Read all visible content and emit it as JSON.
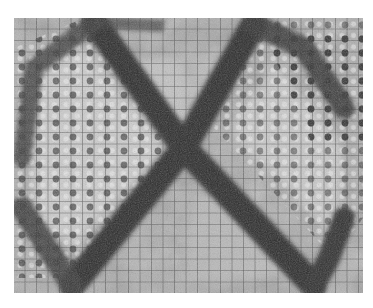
{
  "image": {
    "description": "Grayscale halftone micrograph showing a square grid with an X-shaped dark band formed by two crossing diagonal strips",
    "colors": {
      "background": "#ffffff",
      "field_light": "#bdbdbd",
      "field_mid": "#8a8a8a",
      "band_dark": "#2a2a2a",
      "grid_line": "#3a3a3a",
      "dot": "#262626"
    },
    "bounds": {
      "x": 14,
      "y": 18,
      "width": 349,
      "height": 275
    }
  }
}
